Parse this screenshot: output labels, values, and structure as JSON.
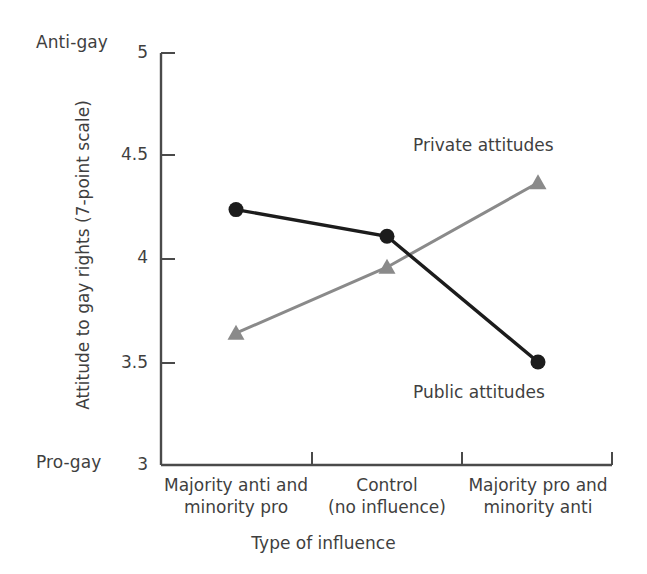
{
  "chart_data": {
    "type": "line",
    "title": "",
    "xlabel": "Type of influence",
    "ylabel": "Attitude to gay rights (7-point scale)",
    "categories": [
      "Majority anti and\nminority pro",
      "Control\n(no influence)",
      "Majority pro and\nminority anti"
    ],
    "category_lines": [
      [
        "Majority anti and",
        "minority pro"
      ],
      [
        "Control",
        "(no influence)"
      ],
      [
        "Majority pro and",
        "minority anti"
      ]
    ],
    "yticks": [
      "3",
      "3.5",
      "4",
      "4.5",
      "5"
    ],
    "ytick_values": [
      3,
      3.5,
      4,
      4.5,
      5
    ],
    "ylim": [
      3,
      5
    ],
    "grid": false,
    "legend_position": "inline-annotation",
    "axis_end_labels": {
      "top": "Anti-gay",
      "bottom": "Pro-gay"
    },
    "series": [
      {
        "name": "Public attitudes",
        "marker": "circle",
        "color": "#1c1c1c",
        "values": [
          4.24,
          4.11,
          3.5
        ]
      },
      {
        "name": "Private attitudes",
        "marker": "triangle",
        "color": "#8a8a8a",
        "values": [
          3.64,
          3.96,
          4.37
        ]
      }
    ]
  },
  "labels": {
    "anti_gay": "Anti-gay",
    "pro_gay": "Pro-gay",
    "y_axis": "Attitude to gay rights (7-point scale)",
    "x_axis": "Type of influence",
    "private_series": "Private attitudes",
    "public_series": "Public attitudes",
    "ytick_5": "5",
    "ytick_45": "4.5",
    "ytick_4": "4",
    "ytick_35": "3.5",
    "ytick_3": "3",
    "cat1_line1": "Majority anti and",
    "cat1_line2": "minority pro",
    "cat2_line1": "Control",
    "cat2_line2": "(no influence)",
    "cat3_line1": "Majority pro and",
    "cat3_line2": "minority anti"
  },
  "colors": {
    "public": "#1c1c1c",
    "private": "#8a8a8a",
    "axis": "#4a4a4a",
    "text": "#3f3f3f",
    "background": "#ffffff"
  }
}
